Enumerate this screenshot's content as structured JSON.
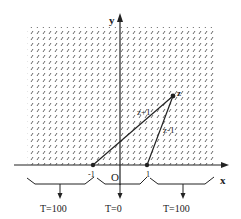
{
  "figure": {
    "axes": {
      "x_label": "x",
      "y_label": "y",
      "origin_label": "O"
    },
    "points": {
      "neg_one": {
        "label": "-1"
      },
      "one": {
        "label": "1"
      },
      "z": {
        "label": "z"
      }
    },
    "segments": {
      "z_plus_1": {
        "label": "z+1"
      },
      "z_minus_1": {
        "label": "z-1"
      }
    },
    "boundary_conditions": [
      {
        "label": "T=100"
      },
      {
        "label": "T=0"
      },
      {
        "label": "T=100"
      }
    ],
    "colors": {
      "ink": "#222222",
      "hatch": "#555555",
      "background": "#ffffff"
    }
  }
}
